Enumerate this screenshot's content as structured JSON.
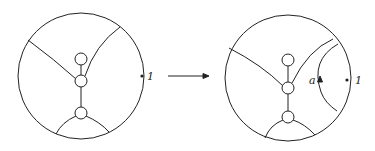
{
  "diagram": {
    "left": {
      "point_label": "1"
    },
    "arrow": {
      "direction": "right"
    },
    "right": {
      "point_label": "1",
      "arc_label": "a"
    },
    "colors": {
      "stroke": "#222222",
      "background": "#ffffff"
    }
  }
}
